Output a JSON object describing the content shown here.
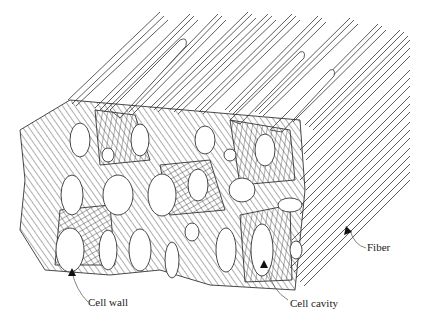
{
  "figure": {
    "labels": {
      "cell_wall": "Cell wall",
      "cell_cavity": "Cell cavity",
      "fiber": "Fiber"
    },
    "colors": {
      "line": "#222222",
      "background": "#ffffff"
    }
  }
}
